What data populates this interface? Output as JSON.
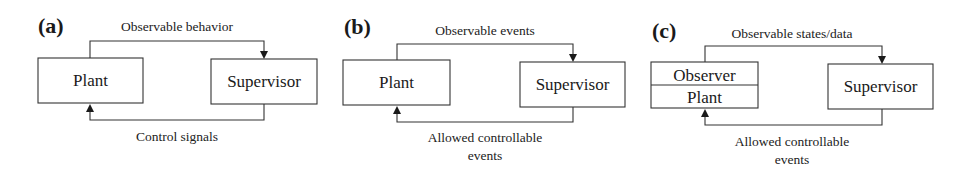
{
  "figure": {
    "panels": [
      {
        "label": "(a)",
        "plant_box": [
          "Plant"
        ],
        "supervisor_box": "Supervisor",
        "top_edge_label": "Observable behavior",
        "bottom_edge_label": [
          "Control signals"
        ]
      },
      {
        "label": "(b)",
        "plant_box": [
          "Plant"
        ],
        "supervisor_box": "Supervisor",
        "top_edge_label": "Observable events",
        "bottom_edge_label": [
          "Allowed controllable",
          "events"
        ]
      },
      {
        "label": "(c)",
        "plant_box": [
          "Observer",
          "Plant"
        ],
        "supervisor_box": "Supervisor",
        "top_edge_label": "Observable states/data",
        "bottom_edge_label": [
          "Allowed controllable",
          "events"
        ]
      }
    ],
    "colors": {
      "line": "#333333",
      "text": "#1a1a1a",
      "background": "#ffffff"
    }
  }
}
